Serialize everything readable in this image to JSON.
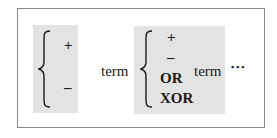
{
  "diagram": {
    "group1": {
      "operators": [
        "+",
        "–"
      ]
    },
    "term1": "term",
    "group2": {
      "operators": [
        "+",
        "–",
        "OR",
        "XOR"
      ]
    },
    "term2": "term",
    "continuation": "•••"
  },
  "colors": {
    "shade": "#e3e3e3",
    "border": "#8a8a8a",
    "text": "#1a1a1a"
  }
}
